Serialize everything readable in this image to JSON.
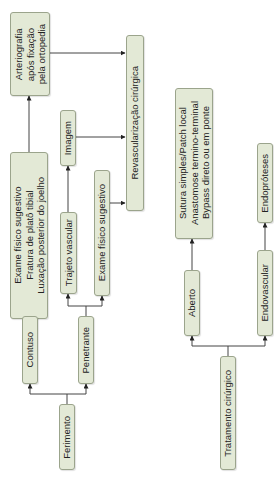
{
  "diagram": {
    "orientation": "rotated-90-ccw",
    "colors": {
      "box_fill": "#e3e9d6",
      "box_border": "#9ba48c",
      "line": "#333333",
      "background": "#ffffff"
    },
    "nodes": {
      "ferimento": {
        "label": "Ferimento"
      },
      "contuso": {
        "label": "Contuso"
      },
      "penetrante": {
        "label": "Penetrante"
      },
      "contuso_findings": {
        "lines": [
          "Exame físico sugestivo",
          "Fratura de platô tibial",
          "Luxação posterior do joelho"
        ]
      },
      "arteriografia": {
        "lines": [
          "Arteriografia",
          "após fixação",
          "pela ortopedia"
        ]
      },
      "trajeto_vascular": {
        "label": "Trajeto vascular"
      },
      "imagem": {
        "label": "Imagem"
      },
      "exame_fisico_penetrante": {
        "label": "Exame físico sugestivo"
      },
      "revascularizacao": {
        "label": "Revascularização cirúrgica"
      },
      "tratamento_cirurgico": {
        "label": "Tratamento cirúrgico"
      },
      "aberto": {
        "label": "Aberto"
      },
      "endovascular": {
        "label": "Endovascular"
      },
      "aberto_options": {
        "lines": [
          "Sutura simples/Patch local",
          "Anastomose termino-terminal",
          "Bypass direto ou em ponte"
        ]
      },
      "endoproteses": {
        "label": "Endopróteses"
      }
    },
    "edges": [
      [
        "ferimento",
        "contuso"
      ],
      [
        "ferimento",
        "penetrante"
      ],
      [
        "contuso",
        "contuso_findings"
      ],
      [
        "contuso_findings",
        "arteriografia"
      ],
      [
        "arteriografia",
        "revascularizacao"
      ],
      [
        "penetrante",
        "trajeto_vascular"
      ],
      [
        "penetrante",
        "exame_fisico_penetrante"
      ],
      [
        "trajeto_vascular",
        "imagem"
      ],
      [
        "imagem",
        "revascularizacao"
      ],
      [
        "exame_fisico_penetrante",
        "revascularizacao"
      ],
      [
        "tratamento_cirurgico",
        "aberto"
      ],
      [
        "tratamento_cirurgico",
        "endovascular"
      ],
      [
        "aberto",
        "aberto_options"
      ],
      [
        "endovascular",
        "endoproteses"
      ]
    ]
  }
}
